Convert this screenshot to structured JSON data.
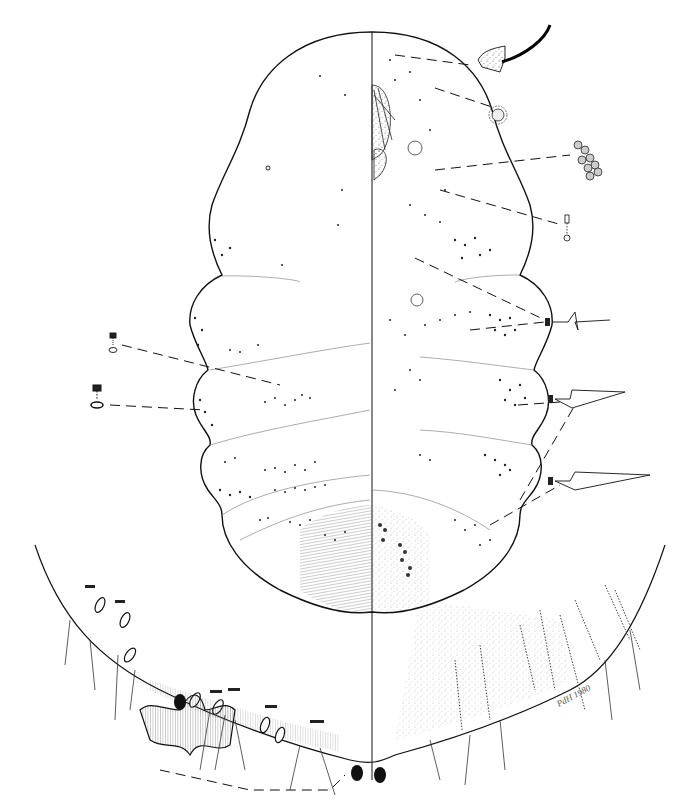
{
  "figure": {
    "layout": {
      "left_half": "dorsum",
      "right_half": "venter",
      "midline_x": 372
    },
    "colors": {
      "ink": "#111111",
      "stipple": "#444444",
      "shading": "#777777",
      "background": "#ffffff"
    },
    "signature": "PdH 1980",
    "insets": [
      {
        "name": "antenna-segment-detail",
        "side": "right",
        "x": 480,
        "y": 40
      },
      {
        "name": "spiracle-pore-detail",
        "side": "right",
        "x": 497,
        "y": 115
      },
      {
        "name": "multilocular-pore-cluster-detail",
        "side": "right",
        "x": 580,
        "y": 155
      },
      {
        "name": "tubular-duct-small-detail",
        "side": "right",
        "x": 565,
        "y": 225
      },
      {
        "name": "ventral-seta-short-detail",
        "side": "right",
        "x": 580,
        "y": 320
      },
      {
        "name": "ventral-seta-medium-detail",
        "side": "right",
        "x": 590,
        "y": 395
      },
      {
        "name": "ventral-seta-long-detail",
        "side": "right",
        "x": 595,
        "y": 475
      },
      {
        "name": "dorsal-oral-collar-duct-small-detail",
        "side": "left",
        "x": 112,
        "y": 343
      },
      {
        "name": "dorsal-oral-collar-duct-large-detail",
        "side": "left",
        "x": 98,
        "y": 395
      },
      {
        "name": "anal-lobe-bar-detail",
        "side": "bottom",
        "x": 190,
        "y": 740
      }
    ],
    "caption": ""
  }
}
